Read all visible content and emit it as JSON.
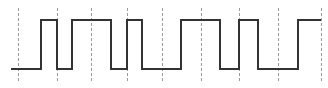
{
  "diagram": {
    "type": "digital-timing-waveform",
    "width": 328,
    "height": 88,
    "colors": {
      "background": "#ffffff",
      "signal": "#333333",
      "grid": "#9a9a9a"
    },
    "levels": {
      "high_y": 20,
      "low_y": 69
    },
    "signal": {
      "start_x": 11,
      "end_x": 321,
      "initial_level": "low",
      "transitions_x": [
        41,
        57,
        72,
        111,
        127,
        142,
        181,
        220,
        239,
        258,
        298
      ],
      "bits_description": "L H L H L H L H L H L H"
    },
    "clock_gridlines": {
      "x": [
        18,
        57,
        91,
        127,
        162,
        201,
        239,
        278,
        321
      ],
      "y_top": 8,
      "y_bottom": 82,
      "style": "dashed"
    }
  }
}
